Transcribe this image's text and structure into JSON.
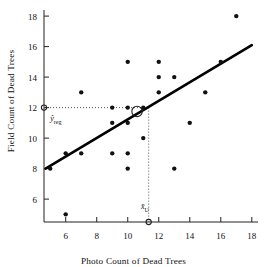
{
  "chart_data": {
    "type": "scatter",
    "title": "",
    "xlabel": "Photo Count of Dead Trees",
    "ylabel": "Field Count of Dead Trees",
    "xlim": [
      4.6,
      18.4
    ],
    "ylim": [
      4.5,
      18.4
    ],
    "xticks": [
      6,
      8,
      10,
      12,
      14,
      16,
      18
    ],
    "yticks": [
      6,
      8,
      10,
      12,
      14,
      16,
      18
    ],
    "xtick_labels": [
      "6",
      "8",
      "10",
      "12",
      "14",
      "16",
      "18"
    ],
    "ytick_labels": [
      "6",
      "8",
      "10",
      "12",
      "14",
      "16",
      "18"
    ],
    "grid": false,
    "legend": false,
    "points": [
      {
        "x": 5,
        "y": 8
      },
      {
        "x": 6,
        "y": 5
      },
      {
        "x": 6,
        "y": 9
      },
      {
        "x": 7,
        "y": 9
      },
      {
        "x": 7,
        "y": 13
      },
      {
        "x": 9,
        "y": 11
      },
      {
        "x": 9,
        "y": 12
      },
      {
        "x": 9,
        "y": 9
      },
      {
        "x": 10,
        "y": 8
      },
      {
        "x": 10,
        "y": 9
      },
      {
        "x": 10,
        "y": 11
      },
      {
        "x": 10,
        "y": 12
      },
      {
        "x": 10,
        "y": 15
      },
      {
        "x": 11,
        "y": 10
      },
      {
        "x": 11,
        "y": 12
      },
      {
        "x": 12,
        "y": 13
      },
      {
        "x": 12,
        "y": 14
      },
      {
        "x": 12,
        "y": 15
      },
      {
        "x": 13,
        "y": 8
      },
      {
        "x": 13,
        "y": 14
      },
      {
        "x": 14,
        "y": 11
      },
      {
        "x": 15,
        "y": 13
      },
      {
        "x": 16,
        "y": 15
      },
      {
        "x": 17,
        "y": 18
      }
    ],
    "regression_line": {
      "x_start": 4.7,
      "y_start": 8.0,
      "x_end": 18.0,
      "y_end": 16.1,
      "slope": 0.609,
      "intercept": 5.14
    },
    "centroid_marker": {
      "x": 10.6,
      "y": 11.75,
      "style": "open-circle"
    },
    "reference_markers": [
      {
        "name": "y-axis-crossing",
        "x": 4.6,
        "y": 12.0,
        "style": "open-circle-small"
      },
      {
        "name": "x-axis-crossing",
        "x": 11.35,
        "y": 4.5,
        "style": "open-circle-small"
      }
    ],
    "guide_lines": [
      {
        "name": "horizontal-dotted-yreg",
        "from": [
          4.6,
          12.0
        ],
        "to": [
          11.35,
          12.0
        ]
      },
      {
        "name": "vertical-dotted-xbar",
        "from": [
          11.35,
          12.0
        ],
        "to": [
          11.35,
          4.5
        ]
      }
    ],
    "annotations": [
      {
        "name": "y-reg-label",
        "text": "ŷ",
        "subscript": "reg",
        "x": 5.0,
        "y": 11.1
      },
      {
        "name": "x-bar-u-label",
        "text": "x̄",
        "subscript": "U",
        "x": 10.85,
        "y": 5.35
      }
    ]
  },
  "axes": {
    "x_title": "Photo Count of Dead Trees",
    "y_title": "Field Count of Dead Trees"
  },
  "colors": {
    "point": "#111111",
    "line": "#000000",
    "axis": "#222222",
    "guide": "#555555",
    "background": "#ffffff"
  },
  "labels": {
    "y_reg": "ŷ",
    "y_reg_sub": "reg",
    "x_bar": "x̄",
    "x_bar_sub": "U"
  }
}
